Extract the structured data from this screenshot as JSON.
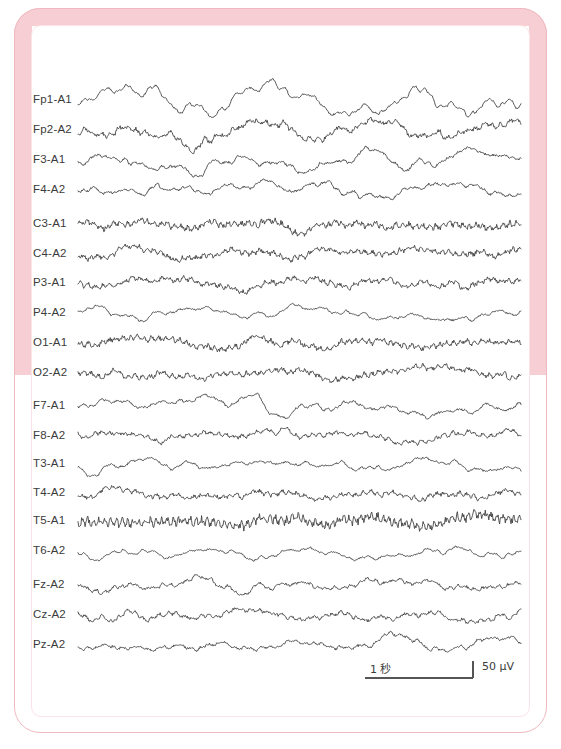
{
  "frame": {
    "border_color": "#f7ced3",
    "outline_color": "#f0b9c0",
    "background": "#ffffff"
  },
  "chart_data": {
    "type": "line",
    "title": "",
    "subtitle": "",
    "xlabel": "",
    "ylabel": "",
    "grid": false,
    "legend_position": "none",
    "trace_color": "#3a3a3a",
    "plot_area": {
      "x0": 78,
      "x1": 521,
      "y_first": 100,
      "row_spacing": 30
    },
    "annotations": {
      "time_scale_label": "1 秒",
      "amplitude_scale_label": "50 μV",
      "time_scale_seconds": 1,
      "amplitude_scale_microvolts": 50,
      "time_bar_px": 108,
      "amplitude_bar_px": 17
    },
    "categories": [
      "Fp1-A1",
      "Fp2-A2",
      "F3-A1",
      "F4-A2",
      "C3-A1",
      "C4-A2",
      "P3-A1",
      "P4-A2",
      "O1-A1",
      "O2-A2",
      "F7-A1",
      "F8-A2",
      "T3-A1",
      "T4-A2",
      "T5-A1",
      "T6-A2",
      "Fz-A2",
      "Cz-A2",
      "Pz-A2"
    ],
    "series": [
      {
        "name": "Fp1-A1",
        "baseline_y": 100,
        "slow_amp": 9.0,
        "slow_freq": 1.1,
        "fast_amp": 1.3,
        "fast_freq": 15,
        "seed": 11,
        "burst_center": 0.22,
        "burst_amp": 10
      },
      {
        "name": "Fp2-A2",
        "baseline_y": 130,
        "slow_amp": 7.0,
        "slow_freq": 1.2,
        "fast_amp": 3.2,
        "fast_freq": 17,
        "seed": 23,
        "burst_center": 0.24,
        "burst_amp": 9
      },
      {
        "name": "F3-A1",
        "baseline_y": 160,
        "slow_amp": 6.0,
        "slow_freq": 1.3,
        "fast_amp": 2.0,
        "fast_freq": 16,
        "seed": 37,
        "burst_center": 0.23,
        "burst_amp": 7
      },
      {
        "name": "F4-A2",
        "baseline_y": 190,
        "slow_amp": 5.0,
        "slow_freq": 1.1,
        "fast_amp": 1.8,
        "fast_freq": 18,
        "seed": 41,
        "burst_center": 0.25,
        "burst_amp": 5
      },
      {
        "name": "C3-A1",
        "baseline_y": 224,
        "slow_amp": 3.2,
        "slow_freq": 1.6,
        "fast_amp": 4.3,
        "fast_freq": 22,
        "seed": 53,
        "burst_center": 0.0,
        "burst_amp": 0
      },
      {
        "name": "C4-A2",
        "baseline_y": 254,
        "slow_amp": 3.4,
        "slow_freq": 1.5,
        "fast_amp": 3.6,
        "fast_freq": 21,
        "seed": 67,
        "burst_center": 0.0,
        "burst_amp": 0
      },
      {
        "name": "P3-A1",
        "baseline_y": 283,
        "slow_amp": 3.4,
        "slow_freq": 1.4,
        "fast_amp": 3.4,
        "fast_freq": 20,
        "seed": 71,
        "burst_center": 0.0,
        "burst_amp": 0
      },
      {
        "name": "P4-A2",
        "baseline_y": 313,
        "slow_amp": 4.2,
        "slow_freq": 1.2,
        "fast_amp": 1.4,
        "fast_freq": 16,
        "seed": 83,
        "burst_center": 0.0,
        "burst_amp": 0
      },
      {
        "name": "O1-A1",
        "baseline_y": 343,
        "slow_amp": 3.0,
        "slow_freq": 1.5,
        "fast_amp": 3.8,
        "fast_freq": 21,
        "seed": 97,
        "burst_center": 0.0,
        "burst_amp": 0
      },
      {
        "name": "O2-A2",
        "baseline_y": 373,
        "slow_amp": 3.2,
        "slow_freq": 1.4,
        "fast_amp": 3.5,
        "fast_freq": 20,
        "seed": 103,
        "burst_center": 0.0,
        "burst_amp": 0
      },
      {
        "name": "F7-A1",
        "baseline_y": 406,
        "slow_amp": 5.2,
        "slow_freq": 1.2,
        "fast_amp": 1.7,
        "fast_freq": 17,
        "seed": 113,
        "burst_center": 0.0,
        "burst_amp": 0
      },
      {
        "name": "F8-A2",
        "baseline_y": 436,
        "slow_amp": 4.6,
        "slow_freq": 1.1,
        "fast_amp": 2.6,
        "fast_freq": 19,
        "seed": 127,
        "burst_center": 0.0,
        "burst_amp": 0
      },
      {
        "name": "T3-A1",
        "baseline_y": 464,
        "slow_amp": 4.0,
        "slow_freq": 1.0,
        "fast_amp": 1.5,
        "fast_freq": 16,
        "seed": 131,
        "burst_center": 0.0,
        "burst_amp": 0
      },
      {
        "name": "T4-A2",
        "baseline_y": 493,
        "slow_amp": 3.2,
        "slow_freq": 1.3,
        "fast_amp": 3.2,
        "fast_freq": 20,
        "seed": 149,
        "burst_center": 0.0,
        "burst_amp": 0
      },
      {
        "name": "T5-A1",
        "baseline_y": 521,
        "slow_amp": 2.6,
        "slow_freq": 1.6,
        "fast_amp": 6.2,
        "fast_freq": 26,
        "seed": 157,
        "burst_center": 0.0,
        "burst_amp": 0
      },
      {
        "name": "T6-A2",
        "baseline_y": 551,
        "slow_amp": 5.0,
        "slow_freq": 1.1,
        "fast_amp": 1.2,
        "fast_freq": 15,
        "seed": 167,
        "burst_center": 0.0,
        "burst_amp": 0
      },
      {
        "name": "Fz-A2",
        "baseline_y": 585,
        "slow_amp": 4.4,
        "slow_freq": 1.2,
        "fast_amp": 2.2,
        "fast_freq": 18,
        "seed": 179,
        "burst_center": 0.0,
        "burst_amp": 0
      },
      {
        "name": "Cz-A2",
        "baseline_y": 615,
        "slow_amp": 4.8,
        "slow_freq": 1.3,
        "fast_amp": 2.4,
        "fast_freq": 18,
        "seed": 191,
        "burst_center": 0.0,
        "burst_amp": 0
      },
      {
        "name": "Pz-A2",
        "baseline_y": 645,
        "slow_amp": 4.2,
        "slow_freq": 1.2,
        "fast_amp": 2.0,
        "fast_freq": 17,
        "seed": 199,
        "burst_center": 0.0,
        "burst_amp": 0
      }
    ]
  }
}
